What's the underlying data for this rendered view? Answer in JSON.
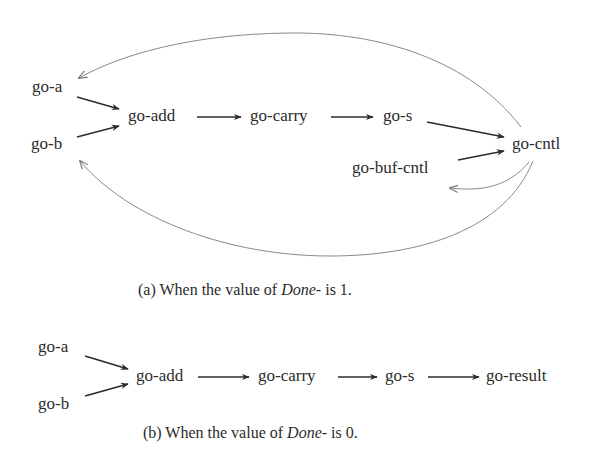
{
  "panel_a": {
    "nodes": {
      "go_a": "go-a",
      "go_b": "go-b",
      "go_add": "go-add",
      "go_carry": "go-carry",
      "go_s": "go-s",
      "go_cntl": "go-cntl",
      "go_buf_cntl": "go-buf-cntl"
    },
    "edges": [
      {
        "from": "go-a",
        "to": "go-add",
        "style": "solid"
      },
      {
        "from": "go-b",
        "to": "go-add",
        "style": "solid"
      },
      {
        "from": "go-add",
        "to": "go-carry",
        "style": "solid"
      },
      {
        "from": "go-carry",
        "to": "go-s",
        "style": "solid"
      },
      {
        "from": "go-s",
        "to": "go-cntl",
        "style": "solid"
      },
      {
        "from": "go-buf-cntl",
        "to": "go-cntl",
        "style": "solid"
      },
      {
        "from": "go-cntl",
        "to": "go-a",
        "style": "thin-curve"
      },
      {
        "from": "go-cntl",
        "to": "go-b",
        "style": "thin-curve"
      },
      {
        "from": "go-cntl",
        "to": "go-buf-cntl",
        "style": "thin-curve"
      }
    ],
    "caption": {
      "prefix": "(a) When the value of ",
      "italic": "Done",
      "suffix": "- is 1."
    }
  },
  "panel_b": {
    "nodes": {
      "go_a": "go-a",
      "go_b": "go-b",
      "go_add": "go-add",
      "go_carry": "go-carry",
      "go_s": "go-s",
      "go_result": "go-result"
    },
    "edges": [
      {
        "from": "go-a",
        "to": "go-add",
        "style": "solid"
      },
      {
        "from": "go-b",
        "to": "go-add",
        "style": "solid"
      },
      {
        "from": "go-add",
        "to": "go-carry",
        "style": "solid"
      },
      {
        "from": "go-carry",
        "to": "go-s",
        "style": "solid"
      },
      {
        "from": "go-s",
        "to": "go-result",
        "style": "solid"
      }
    ],
    "caption": {
      "prefix": "(b) When the value of ",
      "italic": "Done",
      "suffix": "- is 0."
    }
  },
  "colors": {
    "text": "#2b2b2b",
    "arrow": "#2b2b2b",
    "curve": "#8a8a8a",
    "background": "#ffffff"
  }
}
